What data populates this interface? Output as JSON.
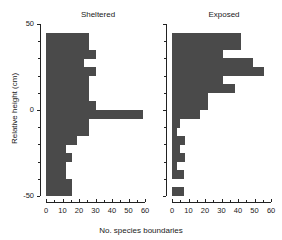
{
  "figure": {
    "ylabel": "Relative height (cm)",
    "xlabel": "No. species boundaries"
  },
  "panels": [
    {
      "title": "Sheltered"
    },
    {
      "title": "Exposed"
    }
  ],
  "axes": {
    "y_ticklabels": [
      "50",
      "0",
      "-50"
    ],
    "y_tick_values": [
      50,
      0,
      -50
    ],
    "x_ticklabels": [
      "0",
      "10",
      "20",
      "30",
      "40",
      "50",
      "60"
    ],
    "x_tick_values": [
      0,
      10,
      20,
      30,
      40,
      50,
      60
    ],
    "bar_color": "#4a4a4a",
    "axis_color": "#222222"
  },
  "chart_data": {
    "type": "bar",
    "orientation": "horizontal",
    "title": "",
    "xlabel": "No. species boundaries",
    "ylabel": "Relative height (cm)",
    "xlim": [
      0,
      63
    ],
    "ylim": [
      -50,
      50
    ],
    "bin_width": 5,
    "grid": false,
    "legend": false,
    "panels": [
      {
        "name": "Sheltered",
        "bins": [
          {
            "height": 42.5,
            "value": 26
          },
          {
            "height": 37.5,
            "value": 26
          },
          {
            "height": 32.5,
            "value": 30
          },
          {
            "height": 27.5,
            "value": 23
          },
          {
            "height": 22.5,
            "value": 30
          },
          {
            "height": 17.5,
            "value": 26
          },
          {
            "height": 12.5,
            "value": 26
          },
          {
            "height": 7.5,
            "value": 26
          },
          {
            "height": 2.5,
            "value": 30
          },
          {
            "height": -2.5,
            "value": 59
          },
          {
            "height": -7.5,
            "value": 26
          },
          {
            "height": -12.5,
            "value": 26
          },
          {
            "height": -17.5,
            "value": 19
          },
          {
            "height": -22.5,
            "value": 12
          },
          {
            "height": -27.5,
            "value": 16
          },
          {
            "height": -32.5,
            "value": 12
          },
          {
            "height": -37.5,
            "value": 12
          },
          {
            "height": -42.5,
            "value": 16
          },
          {
            "height": -47.5,
            "value": 16
          }
        ]
      },
      {
        "name": "Exposed",
        "bins": [
          {
            "height": 42.5,
            "value": 42
          },
          {
            "height": 37.5,
            "value": 42
          },
          {
            "height": 32.5,
            "value": 31
          },
          {
            "height": 27.5,
            "value": 49
          },
          {
            "height": 22.5,
            "value": 56
          },
          {
            "height": 17.5,
            "value": 31
          },
          {
            "height": 12.5,
            "value": 38
          },
          {
            "height": 7.5,
            "value": 22
          },
          {
            "height": 2.5,
            "value": 22
          },
          {
            "height": -2.5,
            "value": 17
          },
          {
            "height": -7.5,
            "value": 5
          },
          {
            "height": -12.5,
            "value": 3
          },
          {
            "height": -17.5,
            "value": 8
          },
          {
            "height": -22.5,
            "value": 5
          },
          {
            "height": -27.5,
            "value": 8
          },
          {
            "height": -32.5,
            "value": 3
          },
          {
            "height": -37.5,
            "value": 7
          },
          {
            "height": -42.5,
            "value": 0
          },
          {
            "height": -47.5,
            "value": 7
          }
        ]
      }
    ]
  }
}
